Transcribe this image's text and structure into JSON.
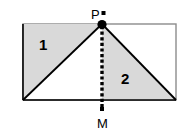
{
  "figure": {
    "labels": {
      "region_one": "1",
      "region_two": "2",
      "point_p": "P",
      "point_m": "M"
    },
    "colors": {
      "shade_fill": "#d9d9d9",
      "outline": "#000000",
      "rectangle_border": "#808080",
      "background": "#ffffff"
    },
    "geometry": {
      "rectangle": {
        "left": 23,
        "top": 24,
        "right": 176,
        "bottom": 100,
        "width": 153,
        "height": 76
      },
      "point_p": {
        "x": 102,
        "y": 24
      },
      "point_m": {
        "x": 102,
        "y": 112
      },
      "foot_of_p": {
        "x": 102,
        "y": 100
      },
      "triangle_one": "(23,24) (102,24) (23,100)",
      "triangle_two": "(102,24) (102,100) (176,100)",
      "dotted_segment": "from P (102,24) down through (102,100) to M (102,112)"
    },
    "markers": {
      "p_vertex_dot_radius": 4.5,
      "p_square_marker": {
        "x": 103,
        "y": 12,
        "size": 4
      },
      "m_square_marker": {
        "x": 101,
        "y": 107,
        "size": 4
      }
    }
  }
}
